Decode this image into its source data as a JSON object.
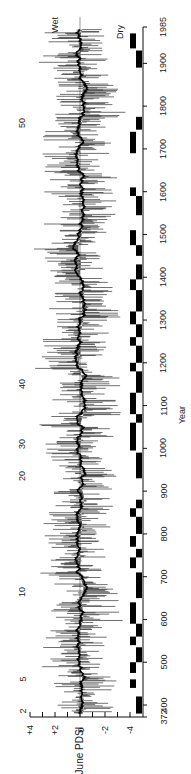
{
  "chart_data": {
    "type": "line",
    "orientation": "rotated-90-ccw",
    "title": "",
    "xlabel": "Year",
    "ylabel": "June PDSI",
    "xlim": [
      372,
      1985
    ],
    "ylim": [
      -4,
      4
    ],
    "x_ticks": [
      372,
      400,
      500,
      600,
      700,
      800,
      900,
      1000,
      1100,
      1200,
      1300,
      1400,
      1500,
      1600,
      1700,
      1800,
      1900,
      1985
    ],
    "y_ticks": [
      "+4",
      "+2",
      "0",
      "-2",
      "-4"
    ],
    "annotations": {
      "wet_label": "Wet",
      "dry_label": "Dry",
      "event_markers": [
        {
          "label": "2",
          "year": 385
        },
        {
          "label": "5",
          "year": 460
        },
        {
          "label": "10",
          "year": 665
        },
        {
          "label": "20",
          "year": 935
        },
        {
          "label": "30",
          "year": 1010
        },
        {
          "label": "40",
          "year": 1150
        },
        {
          "label": "50",
          "year": 1760
        }
      ]
    },
    "series": [
      {
        "name": "Annual June PDSI reconstruction",
        "style": "thin black spikes",
        "range": [
          -4.5,
          4
        ]
      },
      {
        "name": "Smoothed PDSI",
        "style": "thick black line near zero",
        "range": [
          -1,
          0.5
        ]
      }
    ],
    "regime_bars": [
      {
        "start": 380,
        "end": 420,
        "column": "inner"
      },
      {
        "start": 440,
        "end": 460,
        "column": "outer"
      },
      {
        "start": 475,
        "end": 500,
        "column": "outer"
      },
      {
        "start": 500,
        "end": 535,
        "column": "inner"
      },
      {
        "start": 540,
        "end": 560,
        "column": "outer"
      },
      {
        "start": 560,
        "end": 590,
        "column": "inner"
      },
      {
        "start": 590,
        "end": 640,
        "column": "outer"
      },
      {
        "start": 650,
        "end": 710,
        "column": "inner"
      },
      {
        "start": 720,
        "end": 745,
        "column": "outer"
      },
      {
        "start": 745,
        "end": 765,
        "column": "inner"
      },
      {
        "start": 770,
        "end": 795,
        "column": "outer"
      },
      {
        "start": 800,
        "end": 840,
        "column": "inner"
      },
      {
        "start": 840,
        "end": 860,
        "column": "outer"
      },
      {
        "start": 860,
        "end": 880,
        "column": "inner"
      },
      {
        "start": 930,
        "end": 990,
        "column": "inner"
      },
      {
        "start": 995,
        "end": 1060,
        "column": "outer"
      },
      {
        "start": 1060,
        "end": 1080,
        "column": "inner"
      },
      {
        "start": 1080,
        "end": 1130,
        "column": "outer"
      },
      {
        "start": 1130,
        "end": 1180,
        "column": "inner"
      },
      {
        "start": 1180,
        "end": 1200,
        "column": "outer"
      },
      {
        "start": 1200,
        "end": 1240,
        "column": "inner"
      },
      {
        "start": 1240,
        "end": 1260,
        "column": "outer"
      },
      {
        "start": 1260,
        "end": 1290,
        "column": "inner"
      },
      {
        "start": 1290,
        "end": 1320,
        "column": "outer"
      },
      {
        "start": 1320,
        "end": 1370,
        "column": "inner"
      },
      {
        "start": 1370,
        "end": 1395,
        "column": "outer"
      },
      {
        "start": 1395,
        "end": 1430,
        "column": "inner"
      },
      {
        "start": 1450,
        "end": 1475,
        "column": "inner"
      },
      {
        "start": 1475,
        "end": 1510,
        "column": "outer"
      },
      {
        "start": 1545,
        "end": 1590,
        "column": "inner"
      },
      {
        "start": 1590,
        "end": 1610,
        "column": "outer"
      },
      {
        "start": 1690,
        "end": 1740,
        "column": "outer"
      },
      {
        "start": 1745,
        "end": 1775,
        "column": "inner"
      },
      {
        "start": 1890,
        "end": 1930,
        "column": "inner"
      },
      {
        "start": 1935,
        "end": 1970,
        "column": "outer"
      }
    ]
  },
  "labels": {
    "x_axis_title": "Year",
    "y_axis_title": "June PDSI",
    "wet": "Wet",
    "dry": "Dry"
  }
}
